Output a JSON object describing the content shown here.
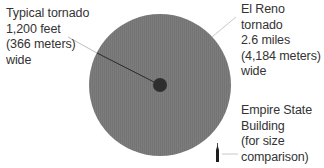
{
  "diagram": {
    "colors": {
      "large_circle": "#7a7a7a",
      "small_circle": "#2e2e2e",
      "leader_line_light": "#c8c8c8",
      "leader_line_dark": "#333333",
      "text": "#333333",
      "background": "#ffffff"
    },
    "typical_tornado": {
      "lines": [
        "Typical tornado",
        "1,200 feet",
        "(366 meters)",
        "wide"
      ],
      "width_feet": 1200,
      "width_meters": 366
    },
    "el_reno_tornado": {
      "lines": [
        "El Reno",
        "tornado",
        "2.6 miles",
        "(4,184 meters)",
        "wide"
      ],
      "width_miles": 2.6,
      "width_meters": 4184
    },
    "empire_state_building": {
      "lines": [
        "Empire State",
        "Building",
        "(for size",
        "comparison)"
      ],
      "icon": "building-icon"
    }
  }
}
